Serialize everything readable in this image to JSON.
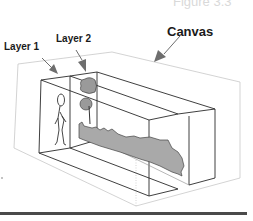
{
  "figure": {
    "caption": "Figure 3.3"
  },
  "labels": {
    "canvas": "Canvas",
    "layer1": "Layer 1",
    "layer2": "Layer 2"
  },
  "colors": {
    "canvas_outline": "#c8c8c8",
    "layer_outline": "#2a2a2a",
    "fill_gray": "#a9a9a9",
    "arrow_gray": "#6e6e6e",
    "rule": "#4a4a4a"
  }
}
